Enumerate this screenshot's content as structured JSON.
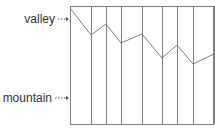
{
  "diagram": {
    "labels": {
      "top": "valley",
      "bottom": "mountain"
    },
    "colors": {
      "line": "#7f7f7f",
      "text": "#333333",
      "arrow": "#555555"
    },
    "box": {
      "left": 70,
      "right": 214,
      "top": 6,
      "bottom": 124
    },
    "vertical_lines_x": [
      70,
      91,
      106,
      121,
      142,
      162,
      177,
      193,
      214
    ],
    "polyline_points": [
      [
        70,
        8
      ],
      [
        91,
        35
      ],
      [
        106,
        24
      ],
      [
        121,
        43
      ],
      [
        142,
        34
      ],
      [
        162,
        58
      ],
      [
        177,
        45
      ],
      [
        193,
        64
      ],
      [
        214,
        54
      ]
    ]
  }
}
